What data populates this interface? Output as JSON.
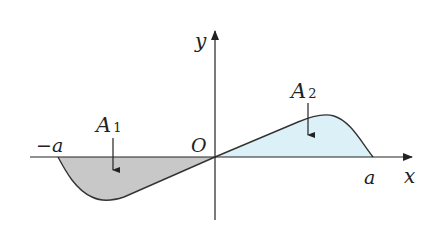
{
  "diagram": {
    "type": "function-area-plot",
    "axes": {
      "x_label": "x",
      "y_label": "y",
      "origin_label": "O"
    },
    "ticks": {
      "left": "−a",
      "right": "a"
    },
    "regions": [
      {
        "id": "A1",
        "label": "A",
        "subscript": "1",
        "side": "below x-axis",
        "interval": "[−a, 0]",
        "fill": "#c8c8c8"
      },
      {
        "id": "A2",
        "label": "A",
        "subscript": "2",
        "side": "above x-axis",
        "interval": "[0, a]",
        "fill": "#dcf0f8"
      }
    ],
    "colors": {
      "axis": "#222222",
      "curve": "#333333",
      "region_a1": "#c8c8c8",
      "region_a2": "#dcf0f8"
    }
  }
}
